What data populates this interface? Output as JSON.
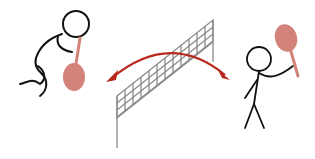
{
  "scene": {
    "description": "Two stick figures playing badminton across a net with a double-headed arc arrow between them",
    "colors": {
      "background": "#ffffff",
      "stroke": "#111111",
      "racket": "#d4837a",
      "arrow": "#b8281c",
      "net": "#8a8a8a"
    },
    "elements": [
      {
        "name": "left-player",
        "pose": "crouching, racket low"
      },
      {
        "name": "net",
        "style": "grid mesh on two posts"
      },
      {
        "name": "right-player",
        "pose": "standing, racket raised"
      },
      {
        "name": "shuttle-arrow",
        "style": "double-headed arc"
      }
    ]
  }
}
